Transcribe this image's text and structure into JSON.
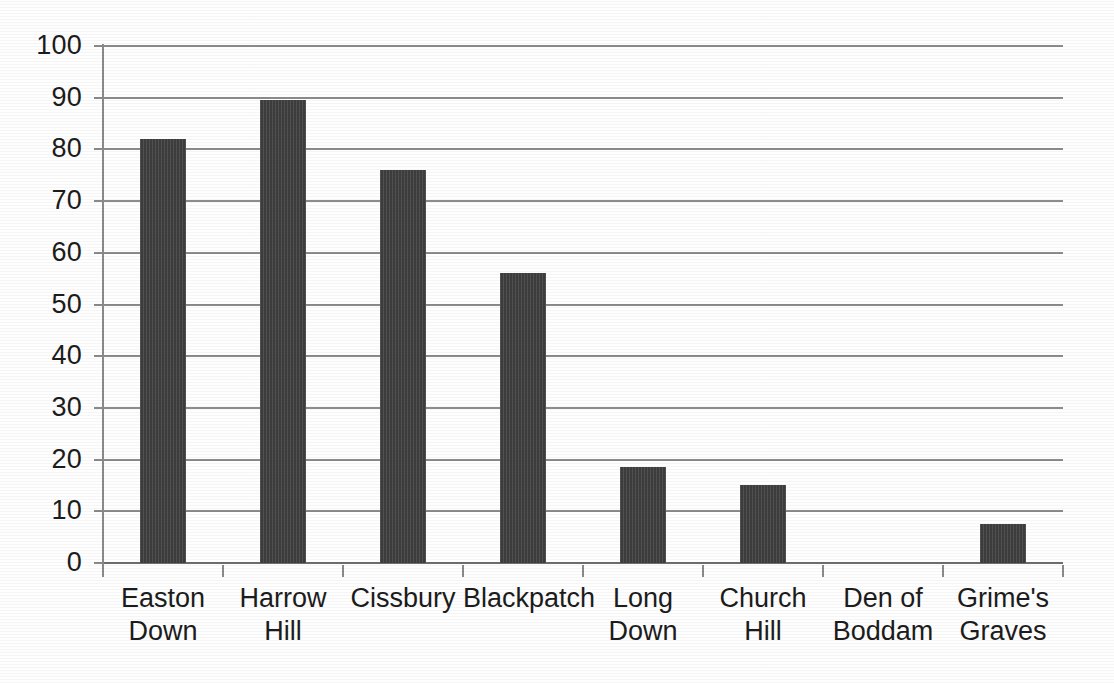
{
  "chart_data": {
    "type": "bar",
    "title": "",
    "subtitle": "",
    "xlabel": "",
    "ylabel": "",
    "categories": [
      "Easton Down",
      "Harrow Hill",
      "Cissbury",
      "Blackpatch",
      "Long Down",
      "Church Hill",
      "Den of Boddam",
      "Grime's Graves"
    ],
    "values": [
      82,
      89.5,
      76,
      56,
      18.5,
      15,
      0,
      7.5
    ],
    "ylim": [
      0,
      100
    ],
    "yticks": [
      0,
      10,
      20,
      30,
      40,
      50,
      60,
      70,
      80,
      90,
      100
    ],
    "ytick_labels": [
      "0",
      "10",
      "20",
      "30",
      "40",
      "50",
      "60",
      "70",
      "80",
      "90",
      "100"
    ],
    "grid": true,
    "legend": false,
    "legend_position": "none",
    "bar_color": "#3d3d3d",
    "gridline_color": "#8c8c8c",
    "axis_color": "#8a8a8a",
    "background_color": "#ffffff"
  },
  "axis": {
    "y_tick_labels": [
      "100",
      "90",
      "80",
      "70",
      "60",
      "50",
      "40",
      "30",
      "20",
      "10",
      "0"
    ],
    "x_tick_labels": [
      [
        "Easton",
        "Down"
      ],
      [
        "Harrow Hill"
      ],
      [
        "Cissbury"
      ],
      [
        "Blackpatch"
      ],
      [
        "Long Down"
      ],
      [
        "Church Hill"
      ],
      [
        "Den of",
        "Boddam"
      ],
      [
        "Grime's",
        "Graves"
      ]
    ]
  }
}
